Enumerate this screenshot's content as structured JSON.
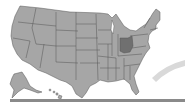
{
  "map": {
    "title": "",
    "region": "United States",
    "highlighted_state": "Ohio",
    "colors": {
      "background": "#ffffff",
      "state_fill": "#a6a6a6",
      "state_stroke": "#555555",
      "highlight_fill": "#707070",
      "swoosh": "#d9d9d9",
      "bottom_bar": "#8a8a8a"
    }
  }
}
